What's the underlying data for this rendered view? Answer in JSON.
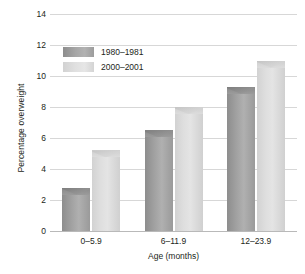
{
  "chart_data": {
    "type": "bar",
    "title": "",
    "subtitle": "",
    "xlabel": "Age (months)",
    "ylabel": "Percentage overweight",
    "categories": [
      "0–5.9",
      "6–11.9",
      "12–23.9"
    ],
    "series": [
      {
        "name": "1980–1981",
        "values": [
          2.8,
          6.5,
          9.3
        ],
        "color": "#a0a0a0"
      },
      {
        "name": "2000–2001",
        "values": [
          5.2,
          8.0,
          11.0
        ],
        "color": "#dcdcdc"
      }
    ],
    "ylim": [
      0,
      14
    ],
    "yticks": [
      0,
      2,
      4,
      6,
      8,
      10,
      12,
      14
    ],
    "ytick_labels": [
      "0",
      "2",
      "4",
      "6",
      "8",
      "10",
      "12",
      "14"
    ],
    "grid": "horizontal",
    "legend_position": "upper-left-inside"
  },
  "axes": {
    "y_title": "Percentage overweight",
    "x_title": "Age (months)"
  },
  "legend": {
    "entries": [
      {
        "label": "1980–1981",
        "swatch": "legend-swatch-dark"
      },
      {
        "label": "2000–2001",
        "swatch": "legend-swatch-light"
      }
    ]
  },
  "colors": {
    "series_1980": "#a0a0a0",
    "series_2000": "#dcdcdc",
    "gridline": "#d7d7d7",
    "baseline": "#b9b9b9",
    "text": "#231f20",
    "background": "#ffffff"
  }
}
